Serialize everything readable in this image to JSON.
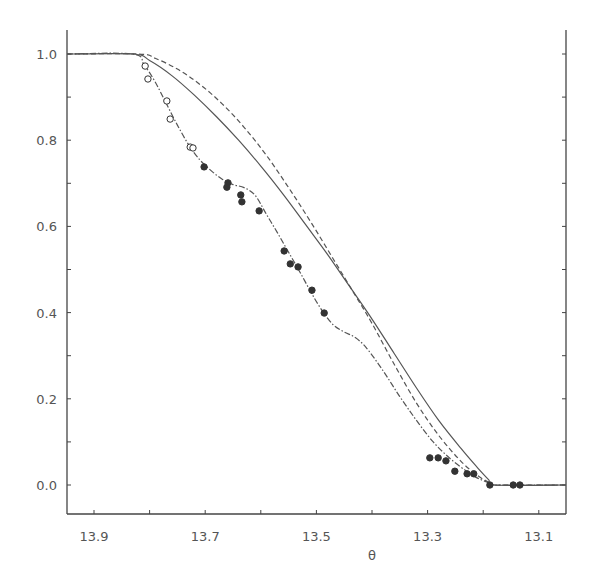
{
  "chart_data": {
    "type": "line",
    "title": "",
    "xlabel": "θ",
    "ylabel": "",
    "xlim": [
      13.95,
      13.05
    ],
    "ylim": [
      -0.07,
      1.06
    ],
    "x_reversed": true,
    "grid": false,
    "legend": null,
    "x_ticks": [
      13.9,
      13.8,
      13.7,
      13.6,
      13.5,
      13.4,
      13.3,
      13.2,
      13.1
    ],
    "x_tick_labels": [
      "13.9",
      "13.7",
      "13.5",
      "13.3",
      "13.1"
    ],
    "x_tick_label_values": [
      13.9,
      13.7,
      13.5,
      13.3,
      13.1
    ],
    "y_ticks": [
      0.0,
      0.1,
      0.2,
      0.3,
      0.4,
      0.5,
      0.6,
      0.7,
      0.8,
      0.9,
      1.0
    ],
    "y_tick_labels": [
      "0.0",
      "0.2",
      "0.4",
      "0.6",
      "0.8",
      "1.0"
    ],
    "y_tick_label_values": [
      0.0,
      0.2,
      0.4,
      0.6,
      0.8,
      1.0
    ],
    "series": [
      {
        "name": "theory-solid",
        "style": "solid",
        "x": [
          13.95,
          13.83,
          13.8,
          13.76,
          13.72,
          13.68,
          13.64,
          13.6,
          13.56,
          13.52,
          13.48,
          13.44,
          13.4,
          13.36,
          13.32,
          13.28,
          13.24,
          13.21,
          13.19,
          13.18,
          13.05
        ],
        "y": [
          1.0,
          1.0,
          0.985,
          0.95,
          0.905,
          0.855,
          0.8,
          0.74,
          0.675,
          0.605,
          0.535,
          0.46,
          0.385,
          0.305,
          0.225,
          0.15,
          0.085,
          0.04,
          0.012,
          0.0,
          0.0
        ]
      },
      {
        "name": "theory-dashed",
        "style": "dashed",
        "x": [
          13.95,
          13.82,
          13.79,
          13.75,
          13.71,
          13.67,
          13.63,
          13.59,
          13.55,
          13.51,
          13.47,
          13.43,
          13.4,
          13.36,
          13.32,
          13.28,
          13.24,
          13.21,
          13.19,
          13.18,
          13.05
        ],
        "y": [
          1.0,
          1.0,
          0.99,
          0.965,
          0.93,
          0.885,
          0.83,
          0.765,
          0.69,
          0.61,
          0.525,
          0.44,
          0.375,
          0.28,
          0.19,
          0.115,
          0.055,
          0.022,
          0.006,
          0.0,
          0.0
        ]
      },
      {
        "name": "fit-dashdot",
        "style": "dashdot",
        "x": [
          13.95,
          13.83,
          13.81,
          13.79,
          13.77,
          13.75,
          13.73,
          13.71,
          13.69,
          13.67,
          13.65,
          13.63,
          13.61,
          13.59,
          13.57,
          13.55,
          13.53,
          13.51,
          13.49,
          13.47,
          13.45,
          13.43,
          13.41,
          13.38,
          13.35,
          13.32,
          13.29,
          13.26,
          13.23,
          13.21,
          13.19,
          13.18,
          13.05
        ],
        "y": [
          1.0,
          1.0,
          0.975,
          0.935,
          0.885,
          0.835,
          0.79,
          0.755,
          0.73,
          0.71,
          0.697,
          0.69,
          0.672,
          0.628,
          0.585,
          0.54,
          0.495,
          0.448,
          0.405,
          0.372,
          0.355,
          0.342,
          0.318,
          0.265,
          0.205,
          0.15,
          0.1,
          0.062,
          0.032,
          0.016,
          0.005,
          0.0,
          0.0
        ]
      }
    ],
    "points": [
      {
        "name": "open-circles",
        "marker": "open-circle",
        "x": [
          13.808,
          13.803,
          13.769,
          13.763,
          13.727,
          13.722
        ],
        "y": [
          0.972,
          0.942,
          0.891,
          0.849,
          0.784,
          0.782
        ]
      },
      {
        "name": "filled-circles",
        "marker": "filled-circle",
        "x": [
          13.702,
          13.659,
          13.661,
          13.636,
          13.634,
          13.603,
          13.558,
          13.547,
          13.533,
          13.508,
          13.486,
          13.296,
          13.281,
          13.267,
          13.251,
          13.229,
          13.217,
          13.188,
          13.146,
          13.134
        ],
        "y": [
          0.738,
          0.701,
          0.691,
          0.673,
          0.657,
          0.636,
          0.543,
          0.513,
          0.506,
          0.452,
          0.399,
          0.063,
          0.063,
          0.056,
          0.032,
          0.026,
          0.026,
          0.0,
          0.0,
          0.0
        ]
      }
    ]
  },
  "layout": {
    "plot_left": 67,
    "plot_right": 566,
    "plot_top": 30,
    "plot_bottom": 514,
    "x_at_13_9": 94,
    "px_per_theta": 556,
    "y_at_0": 485,
    "px_per_unit": 431,
    "line_color": "#555555",
    "axis_color": "#444444",
    "marker_color": "#333333"
  }
}
